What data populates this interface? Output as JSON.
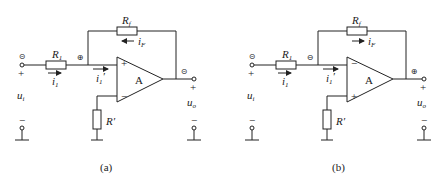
{
  "figures": [
    {
      "id": "a",
      "caption": "(a)",
      "labels": {
        "r1": "R1",
        "r1_sub": "1",
        "rf": "R",
        "rf_sub": "f",
        "rprime": "R′",
        "amp": "A",
        "i1": "i",
        "i1_sub": "1",
        "if": "i",
        "if_sub": "F",
        "i1p": "i",
        "i1p_sub": "1",
        "i1p_prime": "′",
        "ui": "u",
        "ui_sub": "i",
        "uo": "u",
        "uo_sub": "o",
        "plus": "+",
        "minus": "−",
        "top_input": "+",
        "bottom_input": "−",
        "node_in": "⊝",
        "node_mid": "⊕",
        "node_out": "⊝",
        "ground_bar": "−"
      },
      "feedback_arrow": "left"
    },
    {
      "id": "b",
      "caption": "(b)",
      "labels": {
        "r1": "R",
        "r1_sub": "1",
        "rf": "R",
        "rf_sub": "f",
        "rprime": "R′",
        "amp": "A",
        "i1": "i",
        "i1_sub": "1",
        "if": "i",
        "if_sub": "F",
        "i1p": "i",
        "i1p_sub": "1",
        "i1p_prime": "′",
        "ui": "u",
        "ui_sub": "i",
        "uo": "u",
        "uo_sub": "o",
        "plus": "+",
        "minus": "−",
        "top_input": "−",
        "bottom_input": "+",
        "node_in": "⊝",
        "node_mid": "⊖",
        "node_out": "⊕",
        "ground_bar": "−"
      },
      "feedback_arrow": "right"
    }
  ]
}
